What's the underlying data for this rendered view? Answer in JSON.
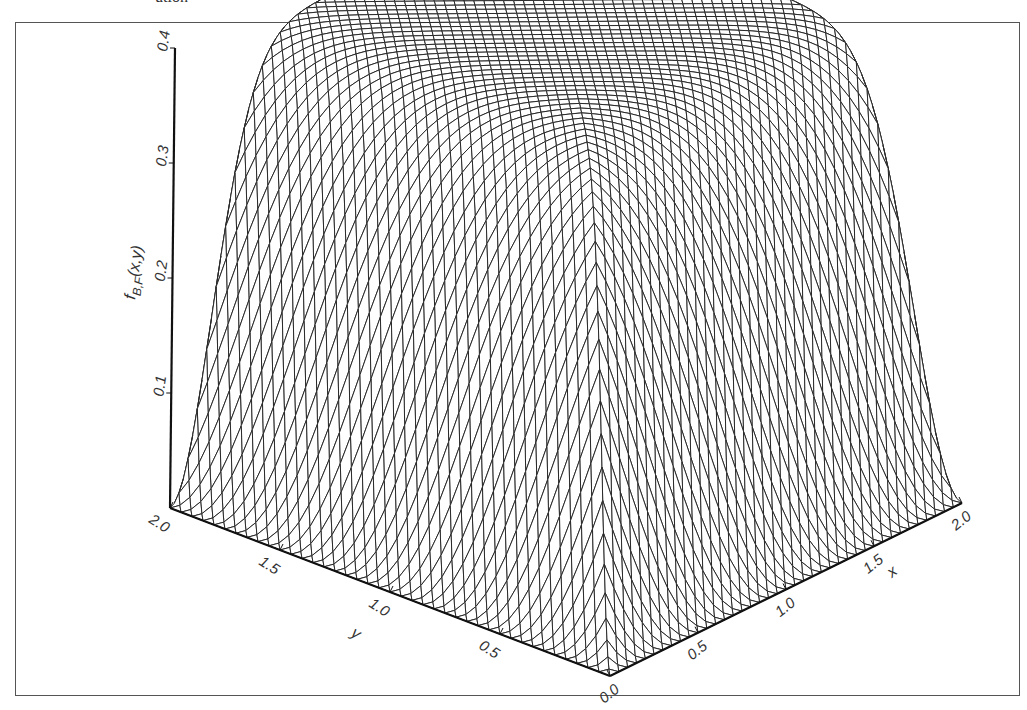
{
  "caption": "ution",
  "chart_data": {
    "type": "surface3d",
    "title": "",
    "zlabel": "f_{B,F}(x,y)",
    "xlabel": "x",
    "ylabel": "y",
    "x_ticks": [
      "0.0",
      "0.5",
      "1.0",
      "1.5",
      "2.0"
    ],
    "y_ticks": [
      "0.5",
      "1.0",
      "1.5",
      "2.0"
    ],
    "z_ticks": [
      "0.1",
      "0.2",
      "0.3",
      "0.4"
    ],
    "xlim": [
      0,
      2
    ],
    "ylim": [
      0,
      2
    ],
    "zlim": [
      0,
      0.4
    ],
    "surface": {
      "description": "Wireframe ridge: near 0 along x=0 and y=0 edges, rising steeply to a plateau of ~0.38 where both x and y exceed ~0.6; diagonal crease along x=y down to 0 at origin",
      "peak_value": 0.38,
      "grid": "diagonal mesh, ~40 lines each direction"
    },
    "grid": false,
    "legend": null
  }
}
